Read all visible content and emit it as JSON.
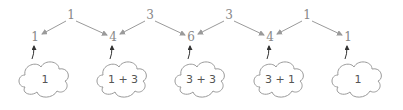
{
  "diagram": {
    "top_row": [
      {
        "label": "1",
        "x": 125,
        "y": 18
      },
      {
        "label": "3",
        "x": 148,
        "y": 18
      },
      {
        "label": "3",
        "x": 226,
        "y": 18
      },
      {
        "label": "1",
        "x": 305,
        "y": 18
      }
    ],
    "middle_row": [
      {
        "label": "1",
        "x": 36,
        "y": 40
      },
      {
        "label": "4",
        "x": 113,
        "y": 40
      },
      {
        "label": "6",
        "x": 191,
        "y": 40
      },
      {
        "label": "4",
        "x": 270,
        "y": 40
      },
      {
        "label": "1",
        "x": 348,
        "y": 40
      }
    ],
    "clouds": [
      {
        "label": "1",
        "x": 45,
        "y": 79
      },
      {
        "label": "1 + 3",
        "x": 121,
        "y": 79
      },
      {
        "label": "3 + 3",
        "x": 199,
        "y": 79
      },
      {
        "label": "3 + 1",
        "x": 278,
        "y": 79
      },
      {
        "label": "1",
        "x": 356,
        "y": 79
      }
    ]
  }
}
